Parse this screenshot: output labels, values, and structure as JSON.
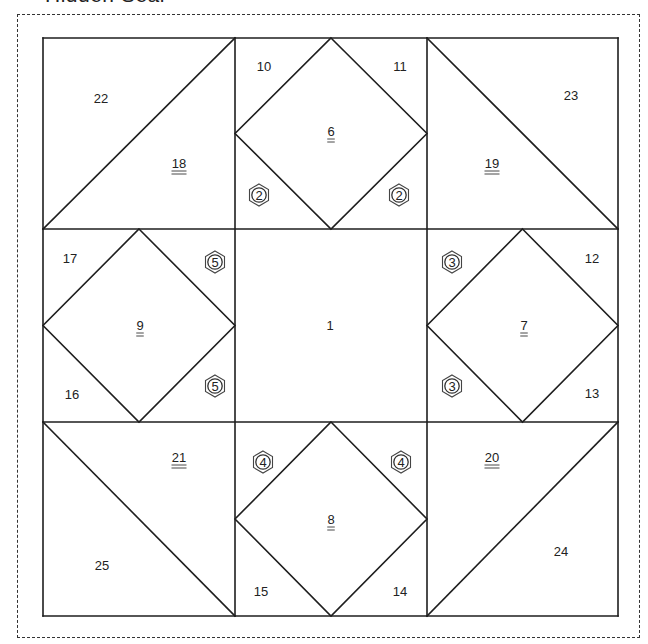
{
  "title": "Hidden Seal",
  "colors": {
    "line": "#1e1e1e",
    "text": "#222222",
    "cut_border": "#333333",
    "background": "#ffffff"
  },
  "block": {
    "grid_x": [
      43,
      235,
      427,
      618
    ],
    "grid_y": [
      38,
      229,
      422,
      616
    ]
  },
  "pieces": [
    {
      "id": "1",
      "label": "1",
      "x": 330,
      "y": 330,
      "underline": 0
    },
    {
      "id": "6",
      "label": "6",
      "x": 331,
      "y": 136,
      "underline": 2
    },
    {
      "id": "7",
      "label": "7",
      "x": 524,
      "y": 330,
      "underline": 2
    },
    {
      "id": "8",
      "label": "8",
      "x": 331,
      "y": 524,
      "underline": 2
    },
    {
      "id": "9",
      "label": "9",
      "x": 140,
      "y": 330,
      "underline": 2
    },
    {
      "id": "10",
      "label": "10",
      "x": 264,
      "y": 71,
      "underline": 0
    },
    {
      "id": "11",
      "label": "11",
      "x": 400,
      "y": 71,
      "underline": 0
    },
    {
      "id": "12",
      "label": "12",
      "x": 592,
      "y": 263,
      "underline": 0
    },
    {
      "id": "13",
      "label": "13",
      "x": 592,
      "y": 398,
      "underline": 0
    },
    {
      "id": "14",
      "label": "14",
      "x": 400,
      "y": 596,
      "underline": 0
    },
    {
      "id": "15",
      "label": "15",
      "x": 261,
      "y": 596,
      "underline": 0
    },
    {
      "id": "16",
      "label": "16",
      "x": 72,
      "y": 399,
      "underline": 0
    },
    {
      "id": "17",
      "label": "17",
      "x": 70,
      "y": 263,
      "underline": 0
    },
    {
      "id": "18",
      "label": "18",
      "x": 179,
      "y": 168,
      "underline": 2
    },
    {
      "id": "19",
      "label": "19",
      "x": 492,
      "y": 168,
      "underline": 2
    },
    {
      "id": "20",
      "label": "20",
      "x": 492,
      "y": 462,
      "underline": 2
    },
    {
      "id": "21",
      "label": "21",
      "x": 179,
      "y": 462,
      "underline": 2
    },
    {
      "id": "22",
      "label": "22",
      "x": 101,
      "y": 103,
      "underline": 0
    },
    {
      "id": "23",
      "label": "23",
      "x": 571,
      "y": 100,
      "underline": 0
    },
    {
      "id": "24",
      "label": "24",
      "x": 561,
      "y": 556,
      "underline": 0
    },
    {
      "id": "25",
      "label": "25",
      "x": 102,
      "y": 570,
      "underline": 0
    }
  ],
  "seam_badges": [
    {
      "label": "2",
      "x": 259,
      "y": 195
    },
    {
      "label": "2",
      "x": 399,
      "y": 195
    },
    {
      "label": "5",
      "x": 215,
      "y": 262
    },
    {
      "label": "5",
      "x": 215,
      "y": 386
    },
    {
      "label": "3",
      "x": 452,
      "y": 262
    },
    {
      "label": "3",
      "x": 452,
      "y": 386
    },
    {
      "label": "4",
      "x": 263,
      "y": 462
    },
    {
      "label": "4",
      "x": 401,
      "y": 462
    }
  ]
}
